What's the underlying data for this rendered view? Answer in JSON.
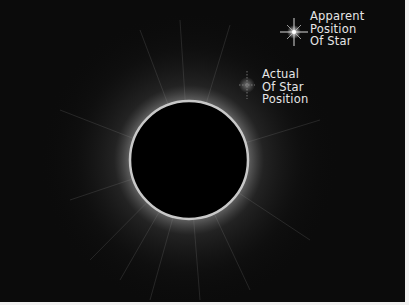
{
  "diagram": {
    "background_color": "#0b0b0b",
    "moon": {
      "cx": 189,
      "cy": 160,
      "r": 59,
      "fill": "#000000",
      "rim_color": "#c8c8c8"
    },
    "labels": {
      "apparent": {
        "lines": [
          "Apparent",
          "Position",
          "Of Star"
        ]
      },
      "actual": {
        "lines": [
          "Actual",
          "Of Star",
          "Position"
        ]
      }
    },
    "icons": {
      "apparent_star": "bright-star-icon",
      "actual_star": "faint-star-icon"
    }
  }
}
